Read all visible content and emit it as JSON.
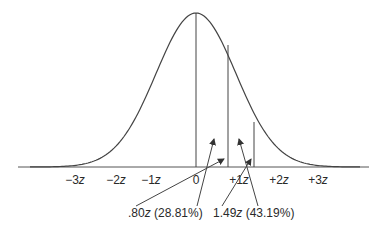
{
  "diagram": {
    "type": "normal-distribution-curve",
    "stroke_color": "#444444",
    "axis_labels": [
      {
        "sign": "−3",
        "unit": "z",
        "x": 75
      },
      {
        "sign": "−2",
        "unit": "z",
        "x": 116
      },
      {
        "sign": "−1",
        "unit": "z",
        "x": 151
      },
      {
        "sign": "0",
        "unit": "",
        "x": 196
      },
      {
        "sign": "+1",
        "unit": "z",
        "x": 239
      },
      {
        "sign": "+2",
        "unit": "z",
        "x": 279
      },
      {
        "sign": "+3",
        "unit": "z",
        "x": 318
      }
    ],
    "annotations": [
      {
        "value": ".80",
        "unit": "z",
        "percent": "(28.81%)",
        "x": 128,
        "y": 206
      },
      {
        "value": "1.49",
        "unit": "z",
        "percent": "(43.19%)",
        "x": 213,
        "y": 206
      }
    ]
  }
}
